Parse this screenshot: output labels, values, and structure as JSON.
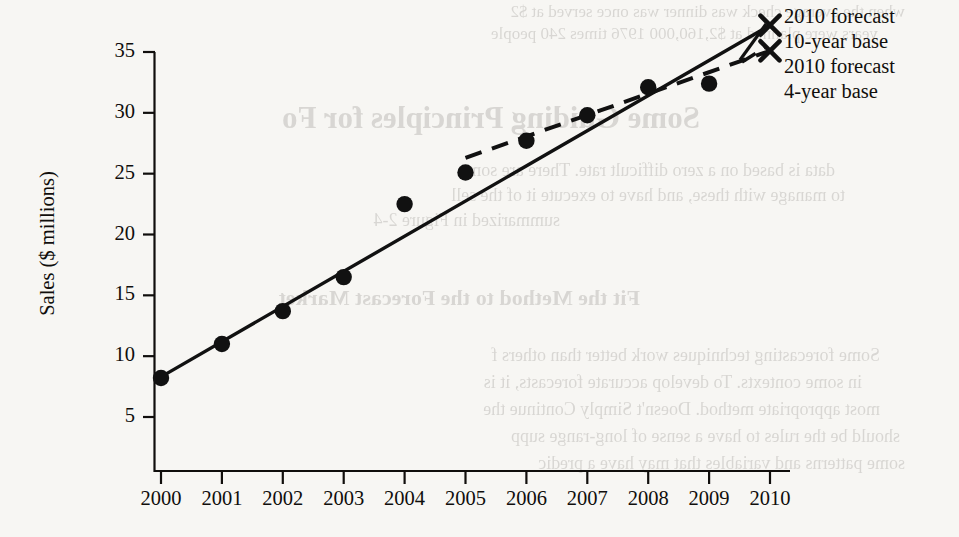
{
  "page": {
    "bleed_text": [
      "when the average check was dinner was once served at $2",
      "years were planned at $2,160,000 1976 times 240 people",
      "Some Guiding Principles for Fo",
      "data is based on a zero difficult rate.  There are some",
      "to manage with these, and have to execute it of the sell",
      "summarized in Figure 2-4",
      "Fit the Method to the Forecast Market",
      "Some forecasting techniques work better than others f",
      "in some contexts. To develop accurate forecasts, it is",
      "most appropriate method. Doesn't Simply Continue the",
      "should be  the rules  to have a sense of long-range supp",
      "some patterns and variables that may have a predic"
    ]
  },
  "chart_data": {
    "type": "scatter",
    "title": "",
    "xlabel": "",
    "ylabel": "Sales ($ millions)",
    "xlim": [
      2000,
      2010
    ],
    "ylim": [
      1.5,
      37.5
    ],
    "yticks": [
      5,
      10,
      15,
      20,
      25,
      30,
      35
    ],
    "xticks": [
      2000,
      2001,
      2002,
      2003,
      2004,
      2005,
      2006,
      2007,
      2008,
      2009,
      2010
    ],
    "grid": false,
    "legend_position": "top-right",
    "x": [
      2000,
      2001,
      2002,
      2003,
      2004,
      2005,
      2006,
      2007,
      2008,
      2009
    ],
    "series": [
      {
        "name": "Sales (actual)",
        "type": "scatter",
        "marker": "filled-circle",
        "color": "#111111",
        "x": [
          2000,
          2001,
          2002,
          2003,
          2004,
          2005,
          2006,
          2007,
          2008,
          2009
        ],
        "values": [
          8.2,
          11.0,
          13.7,
          16.5,
          22.5,
          25.1,
          27.7,
          29.8,
          32.1,
          32.4
        ]
      },
      {
        "name": "10-year base trend",
        "type": "line",
        "style": "solid",
        "color": "#111111",
        "x": [
          2000,
          2010
        ],
        "values": [
          8.3,
          37.2
        ],
        "endpoint_marker": "x",
        "endpoint_value": 37.2
      },
      {
        "name": "4-year base trend",
        "type": "line",
        "style": "dashed",
        "color": "#111111",
        "x": [
          2005,
          2010
        ],
        "values": [
          26.3,
          35.1
        ],
        "endpoint_marker": "x",
        "endpoint_value": 35.1
      }
    ],
    "annotations": [
      {
        "marker": "x",
        "label_line1": "2010 forecast",
        "label_line2": "10-year base",
        "at": [
          2010,
          37.2
        ]
      },
      {
        "marker": "x",
        "label_line1": "2010 forecast",
        "label_line2": "4-year base",
        "at": [
          2010,
          35.1
        ]
      }
    ]
  },
  "legend": {
    "entries": [
      {
        "marker": "x",
        "line1": "2010 forecast",
        "line2": "10-year base"
      },
      {
        "marker": "x",
        "line1": "2010 forecast",
        "line2": "4-year base"
      }
    ],
    "rows": [
      "2010 forecast",
      "10-year base",
      "2010 forecast",
      "4-year base"
    ]
  },
  "axis": {
    "y_title": "Sales ($ millions)",
    "y_tick_labels": [
      "35",
      "30",
      "25",
      "20",
      "15",
      "10",
      "5"
    ],
    "x_tick_labels": [
      "2000",
      "2001",
      "2002",
      "2003",
      "2004",
      "2005",
      "2006",
      "2007",
      "2008",
      "2009",
      "2010"
    ]
  }
}
